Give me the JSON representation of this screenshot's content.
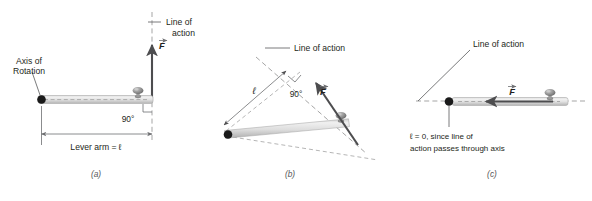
{
  "figure": {
    "panels": [
      {
        "id": "a",
        "letter": "(a)",
        "labels": {
          "axis_of_rotation_line1": "Axis of",
          "axis_of_rotation_line2": "Rotation",
          "line_of_action_line1": "Line of",
          "line_of_action_line2": "action",
          "force_vector": "F",
          "angle": "90°",
          "lever_arm": "Lever arm = ℓ"
        }
      },
      {
        "id": "b",
        "letter": "(b)",
        "labels": {
          "line_of_action": "Line of action",
          "force_vector": "F",
          "angle": "90°",
          "lever_arm_symbol": "ℓ"
        }
      },
      {
        "id": "c",
        "letter": "(c)",
        "labels": {
          "line_of_action": "Line of action",
          "force_vector": "F",
          "note_line1": "ℓ = 0, since line of",
          "note_line2": "action passes through axis"
        }
      }
    ]
  },
  "colors": {
    "background": "#ffffff",
    "ink": "#231f20",
    "leader": "#58595b",
    "dashed": "#9b9b9b",
    "arrow": "#4d4d4f",
    "bar_light": "#e8e8e8",
    "bar_mid": "#c9c9c9",
    "bar_dark": "#9a9a9a",
    "pivot": "#1a1a1a",
    "knob": "#8d8d8d",
    "panel_letter": "#58595b"
  }
}
